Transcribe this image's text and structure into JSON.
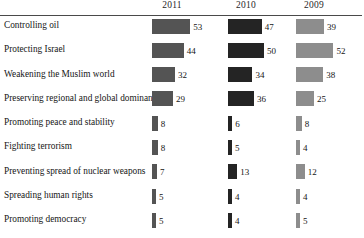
{
  "chart_data": {
    "type": "bar",
    "title": "",
    "xlabel": "",
    "ylabel": "",
    "orientation": "horizontal",
    "grid": false,
    "legend_position": "top",
    "xlim": [
      0,
      53
    ],
    "scale_px_per_unit": 0.72,
    "categories": [
      "Controlling oil",
      "Protecting Israel",
      "Weakening the Muslim world",
      "Preserving regional and global dominance",
      "Promoting peace and stability",
      "Fighting terrorism",
      "Preventing spread of nuclear weapons",
      "Spreading human rights",
      "Promoting democracy"
    ],
    "series": [
      {
        "name": "2011",
        "color": "#545454",
        "values": [
          53,
          44,
          32,
          29,
          8,
          8,
          7,
          5,
          5
        ]
      },
      {
        "name": "2010",
        "color": "#242424",
        "values": [
          47,
          50,
          34,
          36,
          6,
          5,
          13,
          4,
          4
        ]
      },
      {
        "name": "2009",
        "color": "#8d8d8d",
        "values": [
          39,
          52,
          38,
          25,
          8,
          4,
          12,
          4,
          5
        ]
      }
    ]
  },
  "colors": {
    "rule": "#4a4a4a",
    "text": "#151515",
    "background": "#ffffff"
  }
}
